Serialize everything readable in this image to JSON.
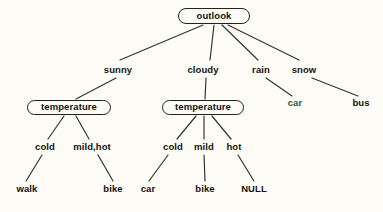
{
  "diagram": {
    "background_color": "#fdfcf7",
    "line_color": "#3a342b",
    "text_color": "#16130f",
    "accent_color": "#2f5a33"
  },
  "nodes": {
    "root": {
      "label": "outlook",
      "x": 214,
      "y": 16,
      "w": 72,
      "h": 16
    },
    "temperature_left": {
      "label": "temperature",
      "x": 69,
      "y": 107,
      "w": 84,
      "h": 15
    },
    "temperature_right": {
      "label": "temperature",
      "x": 203,
      "y": 107,
      "w": 82,
      "h": 15
    }
  },
  "edge_labels": {
    "sunny": {
      "label": "sunny",
      "x": 118,
      "y": 70
    },
    "cloudy": {
      "label": "cloudy",
      "x": 203,
      "y": 70
    },
    "rain": {
      "label": "rain",
      "x": 261,
      "y": 70
    },
    "snow": {
      "label": "snow",
      "x": 304,
      "y": 70
    },
    "cold_left": {
      "label": "cold",
      "x": 45,
      "y": 147
    },
    "mildhot_left": {
      "label": "mild,hot",
      "x": 92,
      "y": 147
    },
    "cold_right": {
      "label": "cold",
      "x": 173,
      "y": 147
    },
    "mild_right": {
      "label": "mild",
      "x": 204,
      "y": 147
    },
    "hot_right": {
      "label": "hot",
      "x": 234,
      "y": 147
    }
  },
  "leaves": {
    "car_rain": {
      "label": "car",
      "x": 295,
      "y": 103,
      "color": "green"
    },
    "bus_snow": {
      "label": "bus",
      "x": 361,
      "y": 103,
      "color": "dark"
    },
    "walk": {
      "label": "walk",
      "x": 27,
      "y": 189,
      "color": "dark"
    },
    "bike_left": {
      "label": "bike",
      "x": 113,
      "y": 189,
      "color": "dark"
    },
    "car_right": {
      "label": "car",
      "x": 148,
      "y": 189,
      "color": "dark"
    },
    "bike_right": {
      "label": "bike",
      "x": 205,
      "y": 189,
      "color": "dark"
    },
    "null_leaf": {
      "label": "NULL",
      "x": 254,
      "y": 189,
      "color": "dark"
    }
  },
  "edges": [
    {
      "from": "outlook",
      "to": "sunny-branch",
      "x1": 203,
      "y1": 25,
      "x2": 120,
      "y2": 60
    },
    {
      "from": "outlook",
      "to": "cloudy-branch",
      "x1": 214,
      "y1": 25,
      "x2": 210,
      "y2": 60
    },
    {
      "from": "outlook",
      "to": "rain-branch",
      "x1": 222,
      "y1": 25,
      "x2": 258,
      "y2": 60
    },
    {
      "from": "outlook",
      "to": "snow-branch",
      "x1": 228,
      "y1": 25,
      "x2": 299,
      "y2": 60
    },
    {
      "from": "sunny-label",
      "to": "temperature-left",
      "x1": 116,
      "y1": 78,
      "x2": 76,
      "y2": 99
    },
    {
      "from": "cloudy-label",
      "to": "temperature-right",
      "x1": 206,
      "y1": 78,
      "x2": 205,
      "y2": 99
    },
    {
      "from": "rain-label",
      "to": "car-leaf",
      "x1": 266,
      "y1": 78,
      "x2": 292,
      "y2": 96
    },
    {
      "from": "snow-label",
      "to": "bus-leaf",
      "x1": 312,
      "y1": 78,
      "x2": 358,
      "y2": 96
    },
    {
      "from": "temperature-left",
      "to": "cold-label",
      "x1": 64,
      "y1": 116,
      "x2": 48,
      "y2": 139
    },
    {
      "from": "temperature-left",
      "to": "mildhot-label",
      "x1": 76,
      "y1": 116,
      "x2": 89,
      "y2": 139
    },
    {
      "from": "temperature-right",
      "to": "cold-label",
      "x1": 196,
      "y1": 116,
      "x2": 177,
      "y2": 139
    },
    {
      "from": "temperature-right",
      "to": "mild-label",
      "x1": 204,
      "y1": 116,
      "x2": 204,
      "y2": 139
    },
    {
      "from": "temperature-right",
      "to": "hot-label",
      "x1": 212,
      "y1": 116,
      "x2": 231,
      "y2": 139
    },
    {
      "from": "cold-left",
      "to": "walk-leaf",
      "x1": 42,
      "y1": 155,
      "x2": 26,
      "y2": 181
    },
    {
      "from": "mildhot-left",
      "to": "bike-leaf",
      "x1": 98,
      "y1": 155,
      "x2": 113,
      "y2": 181
    },
    {
      "from": "cold-right",
      "to": "car-leaf",
      "x1": 168,
      "y1": 155,
      "x2": 149,
      "y2": 181
    },
    {
      "from": "mild-right",
      "to": "bike-leaf",
      "x1": 204,
      "y1": 155,
      "x2": 205,
      "y2": 181
    },
    {
      "from": "hot-right",
      "to": "null-leaf",
      "x1": 238,
      "y1": 155,
      "x2": 254,
      "y2": 181
    }
  ]
}
